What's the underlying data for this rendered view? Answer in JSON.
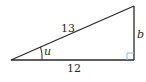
{
  "diagram": {
    "type": "right-triangle",
    "vertices": {
      "angle_vertex": [
        11,
        60
      ],
      "right_angle_vertex": [
        134,
        60
      ],
      "top_vertex": [
        134,
        6
      ]
    },
    "labels": {
      "hypotenuse": "13",
      "adjacent": "12",
      "opposite": "b",
      "angle": "u"
    },
    "colors": {
      "stroke": "#2a2a2a",
      "right_angle_marker": "#8fb8d8",
      "background": "#ffffff"
    }
  }
}
